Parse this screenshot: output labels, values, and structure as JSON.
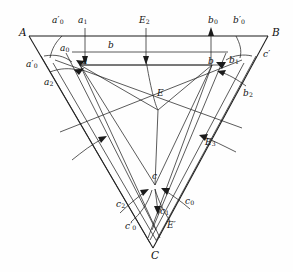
{
  "figure": {
    "type": "geometry-diagram",
    "background_color": "#fefefe",
    "line_color": "#1b1b1b",
    "width": 293,
    "height": 272
  },
  "vertices": [
    {
      "id": "A",
      "label": "A",
      "x": 23,
      "y": 33
    },
    {
      "id": "B",
      "label": "B",
      "x": 274,
      "y": 33
    },
    {
      "id": "C",
      "label": "C",
      "x": 155,
      "y": 255
    }
  ],
  "points": [
    {
      "id": "a",
      "label": "a",
      "sub": "",
      "prime": false,
      "x": 85,
      "y": 63
    },
    {
      "id": "a0",
      "label": "a",
      "sub": "0",
      "prime": false,
      "x": 66,
      "y": 50
    },
    {
      "id": "a1",
      "label": "a",
      "sub": "1",
      "prime": false,
      "x": 82,
      "y": 22
    },
    {
      "id": "a2",
      "label": "a",
      "sub": "2",
      "prime": false,
      "x": 50,
      "y": 83
    },
    {
      "id": "a0p_top",
      "label": "a",
      "sub": "0",
      "prime": true,
      "x": 58,
      "y": 22
    },
    {
      "id": "a0p_left",
      "label": "a",
      "sub": "0",
      "prime": true,
      "x": 32,
      "y": 66
    },
    {
      "id": "b",
      "label": "b",
      "sub": "",
      "prime": false,
      "x": 212,
      "y": 63
    },
    {
      "id": "b_band",
      "label": "b",
      "sub": "",
      "prime": false,
      "x": 110,
      "y": 46
    },
    {
      "id": "b0",
      "label": "b",
      "sub": "0",
      "prime": false,
      "x": 234,
      "y": 60
    },
    {
      "id": "b1",
      "label": "b",
      "sub": "1",
      "prime": false,
      "x": 247,
      "y": 95
    },
    {
      "id": "b2",
      "label": "b",
      "sub": "2",
      "prime": false,
      "x": 213,
      "y": 22
    },
    {
      "id": "b0p_top",
      "label": "b",
      "sub": "0",
      "prime": true,
      "x": 238,
      "y": 22
    },
    {
      "id": "b0p_right",
      "label": "b",
      "sub": "0",
      "prime": true,
      "x": 268,
      "y": 55
    },
    {
      "id": "c",
      "label": "c",
      "sub": "",
      "prime": false,
      "x": 155,
      "y": 178
    },
    {
      "id": "c0",
      "label": "c",
      "sub": "0",
      "prime": false,
      "x": 164,
      "y": 207
    },
    {
      "id": "c1",
      "label": "c",
      "sub": "1",
      "prime": false,
      "x": 120,
      "y": 205
    },
    {
      "id": "c2",
      "label": "c",
      "sub": "2",
      "prime": false,
      "x": 189,
      "y": 202
    },
    {
      "id": "c0p_left",
      "label": "c",
      "sub": "0",
      "prime": true,
      "x": 130,
      "y": 228
    },
    {
      "id": "c0p_right",
      "label": "c",
      "sub": "0",
      "prime": true,
      "x": 172,
      "y": 227
    },
    {
      "id": "E",
      "label": "E",
      "sub": "",
      "prime": false,
      "x": 160,
      "y": 96
    },
    {
      "id": "E1",
      "label": "E",
      "sub": "1",
      "prime": false,
      "x": 143,
      "y": 22
    },
    {
      "id": "E2",
      "label": "E",
      "sub": "2",
      "prime": false,
      "x": 209,
      "y": 143
    },
    {
      "id": "E3",
      "label": "E",
      "sub": "3",
      "prime": false,
      "x": 85,
      "y": 151
    }
  ],
  "labels_reading_order": [
    "A",
    "a'0",
    "a1",
    "E1",
    "b2",
    "b'0",
    "B",
    "a0",
    "b",
    "b'0",
    "a'0",
    "a",
    "b",
    "b0",
    "a2",
    "b1",
    "E",
    "E3",
    "E2",
    "c",
    "c1",
    "c0",
    "c2",
    "c'0",
    "c'0",
    "C"
  ]
}
